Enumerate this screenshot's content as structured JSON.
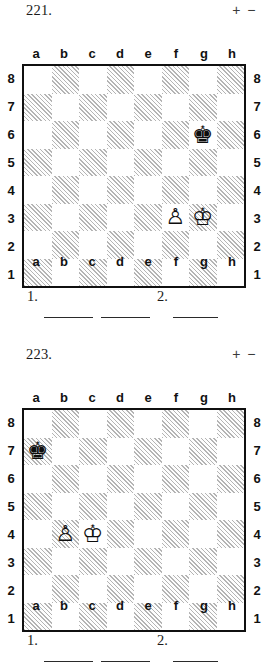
{
  "page": {
    "width": 279,
    "height": 649,
    "background": "#ffffff",
    "ink_color": "#161616"
  },
  "board_labels": {
    "files": [
      "a",
      "b",
      "c",
      "d",
      "e",
      "f",
      "g",
      "h"
    ],
    "ranks": [
      "8",
      "7",
      "6",
      "5",
      "4",
      "3",
      "2",
      "1"
    ]
  },
  "glyphs": {
    "white_king": "♔",
    "white_pawn": "♙",
    "black_king": "♚"
  },
  "puzzles": [
    {
      "number": "221.",
      "evaluation": "+ −",
      "position": {
        "white_king": "g3",
        "white_pawn": "f3",
        "black_king": "g6",
        "pieces": [
          {
            "square": "g6",
            "color": "black",
            "type": "king",
            "glyph": "♚"
          },
          {
            "square": "f3",
            "color": "white",
            "type": "pawn",
            "glyph": "♙"
          },
          {
            "square": "g3",
            "color": "white",
            "type": "king",
            "glyph": "♔"
          }
        ]
      },
      "answer_line": {
        "move_one_label": "1.",
        "move_two_label": "2.",
        "blanks": 3
      }
    },
    {
      "number": "223.",
      "evaluation": "+ −",
      "position": {
        "white_king": "c4",
        "white_pawn": "b4",
        "black_king": "a7",
        "pieces": [
          {
            "square": "a7",
            "color": "black",
            "type": "king",
            "glyph": "♚"
          },
          {
            "square": "b4",
            "color": "white",
            "type": "pawn",
            "glyph": "♙"
          },
          {
            "square": "c4",
            "color": "white",
            "type": "king",
            "glyph": "♔"
          }
        ]
      },
      "answer_line": {
        "move_one_label": "1.",
        "move_two_label": "2.",
        "blanks": 3
      }
    }
  ]
}
